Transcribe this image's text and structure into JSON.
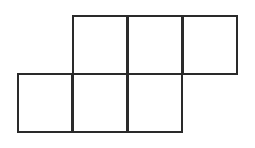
{
  "diagram": {
    "type": "cube-net-grid",
    "stroke_color": "#2a2a2a",
    "background": "#ffffff",
    "cell_size": {
      "w": 56,
      "h": 60
    },
    "rows": [
      {
        "name": "top-row",
        "cells": [
          {
            "x": 72,
            "y": 15
          },
          {
            "x": 127,
            "y": 15
          },
          {
            "x": 182,
            "y": 15
          }
        ]
      },
      {
        "name": "bottom-row",
        "cells": [
          {
            "x": 17,
            "y": 73
          },
          {
            "x": 72,
            "y": 73
          },
          {
            "x": 127,
            "y": 73
          }
        ]
      }
    ]
  }
}
